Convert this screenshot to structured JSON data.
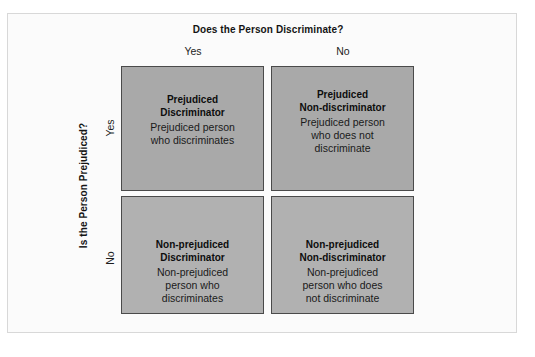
{
  "diagram": {
    "column_axis": {
      "title": "Does the Person Discriminate?",
      "labels": {
        "yes": "Yes",
        "no": "No"
      }
    },
    "row_axis": {
      "title": "Is the Person Prejudiced?",
      "labels": {
        "yes": "Yes",
        "no": "No"
      }
    },
    "cells": {
      "top_left": {
        "title": "Prejudiced\nDiscriminator",
        "description": "Prejudiced person\nwho discriminates"
      },
      "top_right": {
        "title": "Prejudiced\nNon-discriminator",
        "description": "Prejudiced person\nwho does not\ndiscriminate"
      },
      "bottom_left": {
        "title": "Non-prejudiced\nDiscriminator",
        "description": "Non-prejudiced\nperson who\ndiscriminates"
      },
      "bottom_right": {
        "title": "Non-prejudiced\nNon-discriminator",
        "description": "Non-prejudiced\nperson who does\nnot discriminate"
      }
    },
    "colors": {
      "page_background": "#fbfbfb",
      "top_row_fill": "#a9a9a9",
      "bottom_row_fill": "#b1b1b1",
      "cell_border": "#4a4a4a",
      "text": "#141414"
    }
  }
}
